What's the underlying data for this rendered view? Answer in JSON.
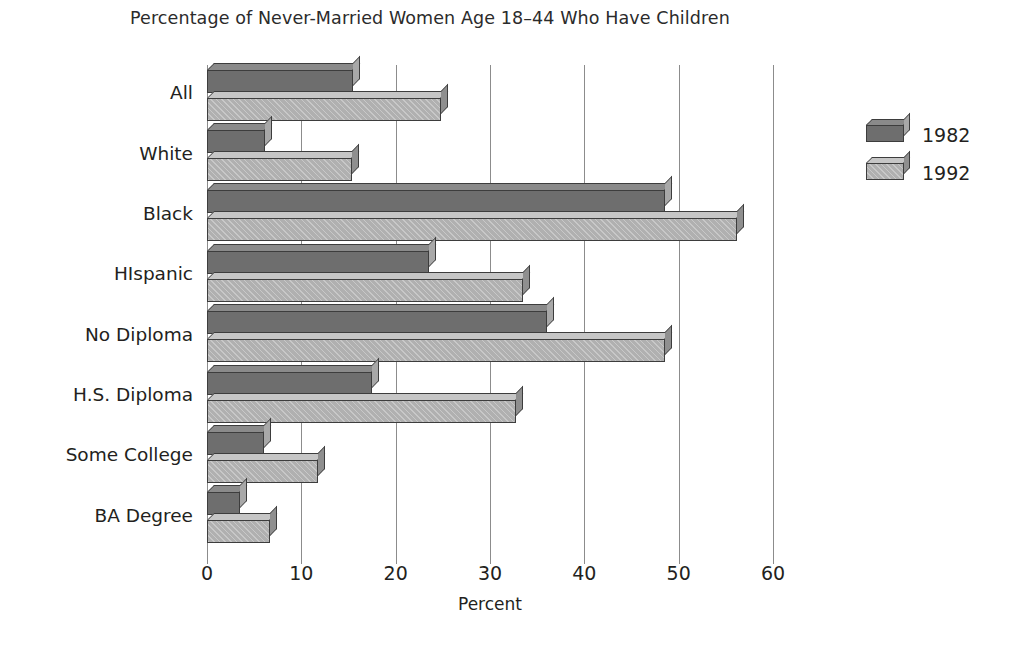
{
  "chart_data": {
    "type": "bar",
    "orientation": "horizontal",
    "title": "Percentage of Never-Married Women Age 18–44 Who Have Children",
    "xlabel": "Percent",
    "ylabel": "",
    "xlim": [
      0,
      60
    ],
    "xticks": [
      0,
      10,
      20,
      30,
      40,
      50,
      60
    ],
    "xtick_labels": [
      "0",
      "10",
      "20",
      "30",
      "40",
      "50",
      "60"
    ],
    "grid": true,
    "grid_axis": "x",
    "legend_position": "right",
    "categories": [
      "All",
      "White",
      "Black",
      "HIspanic",
      "No Diploma",
      "H.S. Diploma",
      "Some College",
      "BA Degree"
    ],
    "series": [
      {
        "name": "1982",
        "color": "#6e6e6e",
        "values": [
          15.5,
          6.2,
          48.5,
          23.5,
          36.0,
          17.5,
          6.0,
          3.5
        ]
      },
      {
        "name": "1992",
        "color": "#b0b0b0",
        "values": [
          24.8,
          15.4,
          56.2,
          33.5,
          48.5,
          32.8,
          11.8,
          6.7
        ]
      }
    ]
  }
}
